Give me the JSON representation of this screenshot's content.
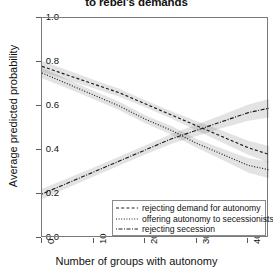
{
  "chart_data": {
    "type": "line",
    "title": "to rebel's demands",
    "xlabel": "Number of groups with autonomy",
    "ylabel": "Average predicted probability",
    "xlim": [
      0,
      44
    ],
    "ylim": [
      0.0,
      1.0
    ],
    "grid": false,
    "legend_position": "bottom-right inside panel",
    "xticks": [
      0,
      10,
      20,
      30,
      40
    ],
    "xtick_labels": [
      "0",
      "10",
      "20",
      "30",
      "40"
    ],
    "yticks": [
      0.0,
      0.2,
      0.4,
      0.6,
      0.8,
      1.0
    ],
    "ytick_labels": [
      "0.0",
      "0.2",
      "0.4",
      "0.6",
      "0.8",
      "1.0"
    ],
    "x": [
      0,
      5,
      10,
      15,
      20,
      25,
      30,
      35,
      40,
      44
    ],
    "series": [
      {
        "name": "rejecting demand for autonomy",
        "style": "dashed",
        "values": [
          0.78,
          0.74,
          0.7,
          0.66,
          0.61,
          0.56,
          0.51,
          0.46,
          0.41,
          0.38
        ],
        "ci_lower": [
          0.755,
          0.718,
          0.681,
          0.642,
          0.594,
          0.543,
          0.489,
          0.433,
          0.378,
          0.342
        ],
        "ci_upper": [
          0.805,
          0.762,
          0.719,
          0.678,
          0.626,
          0.577,
          0.531,
          0.487,
          0.442,
          0.418
        ]
      },
      {
        "name": "offering autonomy to secessionists",
        "style": "dotted",
        "values": [
          0.75,
          0.7,
          0.65,
          0.6,
          0.54,
          0.49,
          0.43,
          0.38,
          0.33,
          0.31
        ],
        "ci_lower": [
          0.726,
          0.679,
          0.631,
          0.581,
          0.522,
          0.47,
          0.41,
          0.354,
          0.297,
          0.272
        ],
        "ci_upper": [
          0.774,
          0.721,
          0.669,
          0.619,
          0.558,
          0.51,
          0.45,
          0.406,
          0.363,
          0.348
        ]
      },
      {
        "name": "rejecting secession",
        "style": "dotdash",
        "values": [
          0.2,
          0.25,
          0.3,
          0.35,
          0.4,
          0.45,
          0.49,
          0.53,
          0.57,
          0.59
        ],
        "ci_lower": [
          0.176,
          0.228,
          0.279,
          0.329,
          0.379,
          0.427,
          0.464,
          0.5,
          0.533,
          0.548
        ],
        "ci_upper": [
          0.224,
          0.272,
          0.321,
          0.371,
          0.421,
          0.473,
          0.516,
          0.56,
          0.607,
          0.632
        ]
      }
    ]
  }
}
